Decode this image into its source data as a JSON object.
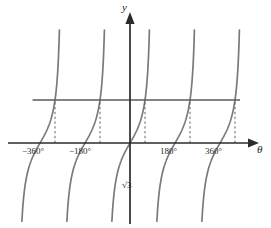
{
  "figure": {
    "background_color": "#ffffff",
    "axis_color": "#2b2b2b",
    "curve_color": "#7a7a7a",
    "dash_color": "#555555",
    "level_line_color": "#5a5a5a"
  },
  "axes": {
    "y_label": "y",
    "theta_label": "θ",
    "x_tick_labels": [
      "−360°",
      "−180°",
      "180°",
      "360°"
    ],
    "level_label": "√3"
  },
  "chart_data": {
    "type": "line",
    "title": "",
    "xlabel": "θ",
    "ylabel": "y",
    "xlim": [
      -430,
      470
    ],
    "ylim": [
      -5.2,
      5.2
    ],
    "grid": false,
    "legend": "none",
    "series": [
      {
        "name": "y = tan θ",
        "period_degrees": 180,
        "zeros_degrees": [
          -360,
          -180,
          0,
          180,
          360
        ],
        "asymptotes_degrees": [
          -450,
          -270,
          -90,
          90,
          270,
          450
        ],
        "branch_count": 5
      },
      {
        "name": "y = √3",
        "type": "horizontal_line",
        "value": 1.732,
        "x_start_degrees": -390,
        "x_end_degrees": 440
      }
    ],
    "annotations": [
      {
        "text": "−360°",
        "x": -360,
        "y": 0,
        "role": "x-tick"
      },
      {
        "text": "−180°",
        "x": -180,
        "y": 0,
        "role": "x-tick"
      },
      {
        "text": "180°",
        "x": 180,
        "y": 0,
        "role": "x-tick"
      },
      {
        "text": "360°",
        "x": 360,
        "y": 0,
        "role": "x-tick"
      },
      {
        "text": "√3",
        "x": 20,
        "y": 1.732,
        "role": "level-label"
      },
      {
        "text": "y",
        "x": 0,
        "y": 5.1,
        "role": "axis-label"
      },
      {
        "text": "θ",
        "x": 460,
        "y": -0.35,
        "role": "axis-label"
      }
    ],
    "dashed_verticals_degrees": [
      -300,
      -120,
      60,
      240,
      420
    ],
    "intersections": [
      {
        "theta_degrees": -300,
        "y": 1.732
      },
      {
        "theta_degrees": -120,
        "y": 1.732
      },
      {
        "theta_degrees": 60,
        "y": 1.732
      },
      {
        "theta_degrees": 240,
        "y": 1.732
      },
      {
        "theta_degrees": 420,
        "y": 1.732
      }
    ]
  }
}
